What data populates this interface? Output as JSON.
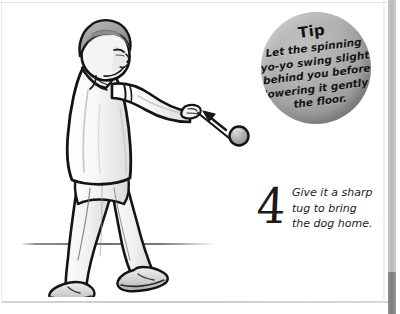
{
  "page": {
    "background_color": "#ffffff",
    "ink_color": "#1a1a1a"
  },
  "tip": {
    "title": "Tip",
    "lines": [
      "Let the spinning",
      "yo-yo swing slightly",
      "behind you before",
      "lowering it gently to",
      "the floor."
    ],
    "bubble_color": "#a8a8a8"
  },
  "step": {
    "number": "4",
    "lines": [
      "Give it a sharp",
      "tug to bring",
      "the dog home."
    ]
  },
  "illustration": {
    "subject": "boy-swinging-yo-yo",
    "arrow_direction": "up-left",
    "skin_color": "#f2f2f2",
    "hair_color": "#9b9b9b",
    "shirt_color": "#f4f4f4",
    "pants_color": "#f2f2f2",
    "shoe_color": "#cfcfcf",
    "yoyo_color": "#a6a6a6",
    "outline_color": "#141414"
  }
}
